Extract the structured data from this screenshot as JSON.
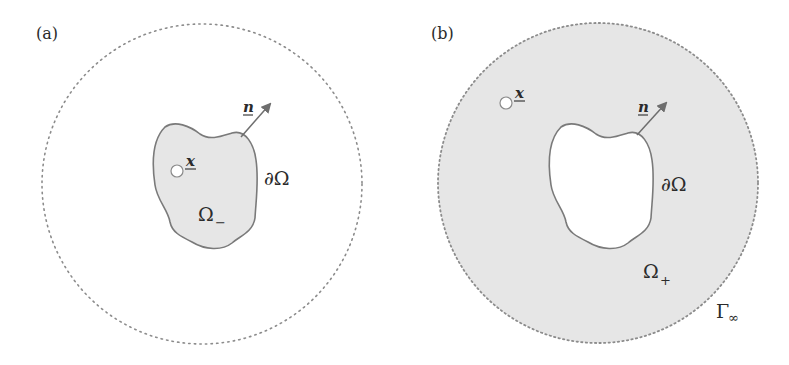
{
  "figure": {
    "colors": {
      "background": "#ffffff",
      "domain_fill": "#e6e6e6",
      "boundary_stroke": "#7a7a7a",
      "dotted_circle": "#8c8c8c",
      "arrow": "#6e6e6e",
      "text": "#2b2b2b"
    },
    "panels": [
      {
        "id": "a",
        "label": "(a)",
        "outer_circle": {
          "cx": 202,
          "cy": 184,
          "r": 160,
          "style": "dotted",
          "filled": false
        },
        "domain_label": "Ω",
        "domain_subscript": "−",
        "boundary_label": "∂Ω",
        "normal_label": "n",
        "point_label": "x",
        "shaded_region": "interior of ∂Ω"
      },
      {
        "id": "b",
        "label": "(b)",
        "outer_circle": {
          "cx": 598,
          "cy": 183,
          "r": 160,
          "style": "dotted",
          "filled": true
        },
        "domain_label": "Ω",
        "domain_subscript": "+",
        "boundary_label": "∂Ω",
        "normal_label": "n",
        "point_label": "x",
        "far_boundary_label": "Γ",
        "far_boundary_subscript": "∞",
        "shaded_region": "between ∂Ω and Γ∞"
      }
    ]
  }
}
